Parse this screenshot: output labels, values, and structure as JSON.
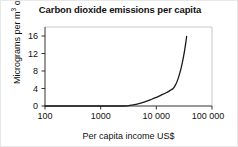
{
  "chart_data": {
    "type": "line",
    "title": "Carbon dioxide emissions per capita",
    "xlabel": "Per capita income US$",
    "ylabel": "Micrograms per m3 of air",
    "ylabel_prefix": "Micrograms per m",
    "ylabel_superscript": "3",
    "ylabel_suffix": " of air",
    "xscale": "log",
    "yscale": "linear",
    "xlim": [
      100,
      100000
    ],
    "ylim": [
      0,
      18.5
    ],
    "xticks": [
      100,
      1000,
      10000,
      100000
    ],
    "xtick_labels": [
      "100",
      "1000",
      "10 000",
      "100 000"
    ],
    "yticks": [
      0,
      4,
      8,
      12,
      16
    ],
    "ytick_labels": [
      "0",
      "4",
      "8",
      "12",
      "16"
    ],
    "grid": false,
    "legend": false,
    "series": [
      {
        "name": "CO2 emissions per capita",
        "color": "#1a1a1a",
        "x": [
          100,
          1000,
          2000,
          3000,
          4000,
          5000,
          6000,
          8000,
          10000,
          12000,
          15000,
          18000,
          20000,
          22000,
          24000,
          26000,
          28000,
          30000,
          32000,
          34000,
          35000
        ],
        "y": [
          0,
          0,
          0,
          0.05,
          0.3,
          0.6,
          0.9,
          1.5,
          2.0,
          2.5,
          3.1,
          3.7,
          4.1,
          4.9,
          6.0,
          7.4,
          9.0,
          10.8,
          12.8,
          15.0,
          16.3
        ]
      }
    ]
  },
  "axes": {
    "tick_color": "#333333",
    "axis_color": "#333333",
    "frame_color": "#c8c8c8"
  }
}
